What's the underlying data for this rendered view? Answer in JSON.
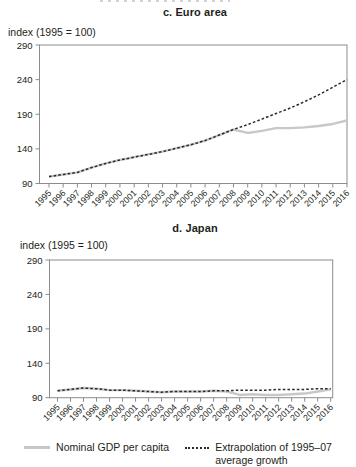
{
  "colors": {
    "nominal_line": "#c8c8c8",
    "extrapolation_line": "#2b2a29",
    "axis": "#8a8c8e",
    "text": "#231f20"
  },
  "legend": {
    "items": [
      {
        "label": "Nominal GDP per capita",
        "swatch": "solid-gray-line"
      },
      {
        "label": "Extrapolation of 1995–07\naverage growth",
        "swatch": "dotted-black-line"
      }
    ]
  },
  "chart_data": [
    {
      "type": "line",
      "title": "c. Euro area",
      "ylabel_caption": "index (1995 = 100)",
      "x": [
        1995,
        1996,
        1997,
        1998,
        1999,
        2000,
        2001,
        2002,
        2003,
        2004,
        2005,
        2006,
        2007,
        2008,
        2009,
        2010,
        2011,
        2012,
        2013,
        2014,
        2015,
        2016
      ],
      "ylim": [
        90,
        290
      ],
      "yticks": [
        90,
        140,
        190,
        240,
        290
      ],
      "grid": false,
      "legend_position": "bottom-shared",
      "series": [
        {
          "name": "Nominal GDP per capita",
          "style": "solid",
          "color": "#c8c8c8",
          "values": [
            100,
            103,
            106,
            113,
            119,
            124,
            128,
            132,
            136,
            141,
            146,
            152,
            160,
            168,
            163,
            166,
            170,
            170,
            171,
            173,
            176,
            181
          ]
        },
        {
          "name": "Extrapolation of 1995–07 average growth",
          "style": "dotted",
          "color": "#2b2a29",
          "values": [
            100,
            103,
            106,
            113,
            119,
            124,
            128,
            132,
            136,
            141,
            146,
            152,
            160,
            168,
            175,
            183,
            191,
            199,
            208,
            218,
            229,
            240
          ]
        }
      ]
    },
    {
      "type": "line",
      "title": "d. Japan",
      "ylabel_caption": "index (1995 = 100)",
      "x": [
        1995,
        1996,
        1997,
        1998,
        1999,
        2000,
        2001,
        2002,
        2003,
        2004,
        2005,
        2006,
        2007,
        2008,
        2009,
        2010,
        2011,
        2012,
        2013,
        2014,
        2015,
        2016
      ],
      "ylim": [
        90,
        290
      ],
      "yticks": [
        90,
        140,
        190,
        240,
        290
      ],
      "grid": false,
      "legend_position": "bottom-shared",
      "series": [
        {
          "name": "Nominal GDP per capita",
          "style": "solid",
          "color": "#c8c8c8",
          "values": [
            100,
            102,
            104,
            103,
            101,
            101,
            100,
            99,
            98,
            99,
            99,
            99,
            100,
            99,
            94,
            95,
            94,
            94,
            95,
            96,
            99,
            102
          ]
        },
        {
          "name": "Extrapolation of 1995–07 average growth",
          "style": "dotted",
          "color": "#2b2a29",
          "values": [
            100,
            102,
            104,
            103,
            101,
            101,
            100,
            99,
            98,
            99,
            99,
            99,
            100,
            100,
            101,
            101,
            101,
            102,
            102,
            102,
            103,
            103
          ]
        }
      ]
    }
  ]
}
